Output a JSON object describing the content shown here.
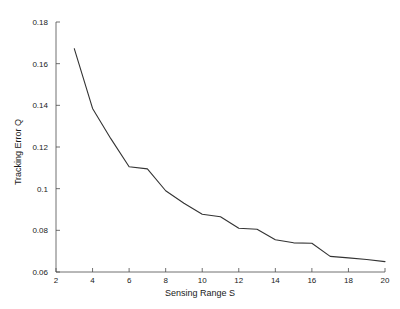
{
  "chart_data": {
    "type": "line",
    "title": "",
    "xlabel": "Sensing Range S",
    "ylabel": "Tracking Error Q",
    "xlim": [
      2,
      20
    ],
    "ylim": [
      0.06,
      0.18
    ],
    "xticks": [
      "2",
      "4",
      "6",
      "8",
      "10",
      "12",
      "14",
      "16",
      "18",
      "20"
    ],
    "yticks": [
      "0.06",
      "0.08",
      "0.1",
      "0.12",
      "0.14",
      "0.16",
      "0.18"
    ],
    "xtick_values": [
      2,
      4,
      6,
      8,
      10,
      12,
      14,
      16,
      18,
      20
    ],
    "ytick_values": [
      0.06,
      0.08,
      0.1,
      0.12,
      0.14,
      0.16,
      0.18
    ],
    "grid": false,
    "legend": null,
    "series": [
      {
        "name": "Tracking Error Q",
        "color": "#333333",
        "x": [
          3,
          4,
          5,
          6,
          7,
          8,
          9,
          10,
          11,
          12,
          13,
          14,
          15,
          16,
          17,
          18,
          19,
          20
        ],
        "values": [
          0.1672,
          0.1385,
          0.124,
          0.1105,
          0.1095,
          0.099,
          0.093,
          0.0877,
          0.0865,
          0.081,
          0.0805,
          0.0755,
          0.074,
          0.0738,
          0.0675,
          0.0668,
          0.066,
          0.065
        ]
      }
    ]
  }
}
